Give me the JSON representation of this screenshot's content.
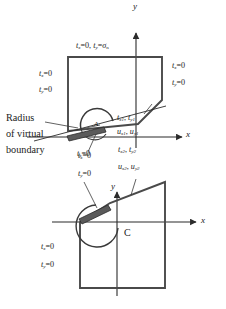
{
  "figure": {
    "type": "engineering-diagram"
  },
  "annotation": {
    "radius_note_line1": "Radius",
    "radius_note_line2": "of virtual",
    "radius_note_line3": "boundary"
  },
  "upper": {
    "axis_x": "x",
    "axis_y": "y",
    "top_traction": {
      "tx": "t",
      "tx_sub": "x",
      "tx_val": "=0,",
      "ty": "t",
      "ty_sub": "y",
      "ty_val": "=",
      "sigma": "σ",
      "sigma_sub": "n"
    },
    "left_tx": {
      "sym": "t",
      "sub": "x",
      "val": "=0"
    },
    "left_ty": {
      "sym": "t",
      "sub": "y",
      "val": "=0"
    },
    "right_tx": {
      "sym": "t",
      "sub": "x",
      "val": "=0"
    },
    "right_ty": {
      "sym": "t",
      "sub": "y",
      "val": "=0"
    },
    "crack_tx": {
      "sym": "t",
      "sub": "x",
      "val": "=0"
    },
    "crack_ty": {
      "sym": "t",
      "sub": "y",
      "val": "=0"
    },
    "region_a": "A",
    "traction_1": {
      "a_sym": "t",
      "a_sub": "x1",
      "b_sym": "t",
      "b_sub": "y1"
    },
    "disp_1": {
      "a_sym": "u",
      "a_sub": "x1",
      "b_sym": "u",
      "b_sub": "y1"
    },
    "traction_2": {
      "a_sym": "t",
      "a_sub": "x2",
      "b_sym": "t",
      "b_sub": "y2"
    },
    "disp_2": {
      "a_sym": "u",
      "a_sub": "x2",
      "b_sym": "u",
      "b_sub": "y2"
    }
  },
  "lower": {
    "axis_x": "x",
    "axis_y": "y",
    "curve_label": "C",
    "crack_tx": {
      "sym": "t",
      "sub": "x",
      "val": "=0"
    },
    "crack_ty": {
      "sym": "t",
      "sub": "y",
      "val": "=0"
    },
    "left_tx": {
      "sym": "t",
      "sub": "x",
      "val": "=0"
    },
    "left_ty": {
      "sym": "t",
      "sub": "y",
      "val": "=0"
    },
    "traction_2": {
      "a_sym": "t",
      "a_sub": "x2",
      "b_sym": "t",
      "b_sub": "y2"
    },
    "disp_2": {
      "a_sym": "u",
      "a_sub": "x2",
      "b_sym": "u",
      "b_sub": "y2"
    }
  },
  "colors": {
    "ink": "#1a1a1a",
    "line": "#3a3a3a",
    "fill_crack": "#555555",
    "background": "#ffffff"
  }
}
